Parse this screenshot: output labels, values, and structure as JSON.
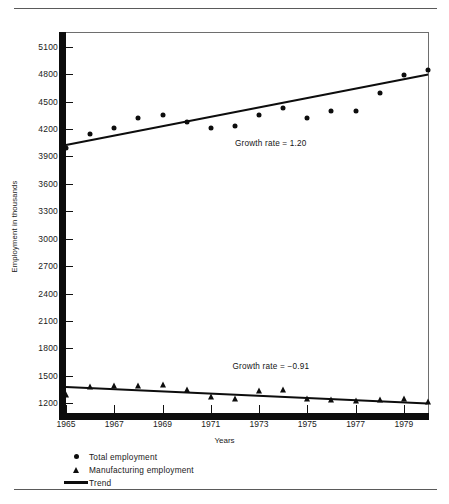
{
  "chart_data": {
    "type": "scatter",
    "title": "",
    "xlabel": "Years",
    "ylabel": "Employment in thousands",
    "xlim": [
      1965,
      1980
    ],
    "ylim": [
      1050,
      5250
    ],
    "ytick_labels": [
      "5100",
      "4800",
      "4500",
      "4200",
      "3900",
      "3600",
      "3300",
      "3000",
      "2700",
      "2400",
      "2100",
      "1800",
      "1500",
      "1200"
    ],
    "ytick_values": [
      5100,
      4800,
      4500,
      4200,
      3900,
      3600,
      3300,
      3000,
      2700,
      2400,
      2100,
      1800,
      1500,
      1200
    ],
    "xtick_labels": [
      "1965",
      "1967",
      "1969",
      "1971",
      "1973",
      "1975",
      "1977",
      "1979"
    ],
    "xtick_values": [
      1965,
      1967,
      1969,
      1971,
      1973,
      1975,
      1977,
      1979
    ],
    "grid": false,
    "legend_position": "below-axes",
    "series": [
      {
        "name": "Total employment",
        "marker": "circle",
        "x": [
          1965,
          1966,
          1967,
          1968,
          1969,
          1970,
          1971,
          1972,
          1973,
          1974,
          1975,
          1976,
          1977,
          1978,
          1979,
          1980
        ],
        "values": [
          3990,
          4140,
          4215,
          4320,
          4355,
          4280,
          4215,
          4230,
          4355,
          4430,
          4325,
          4400,
          4400,
          4595,
          4790,
          4840
        ]
      },
      {
        "name": "Manufacturing employment",
        "marker": "triangle",
        "x": [
          1965,
          1966,
          1967,
          1968,
          1969,
          1970,
          1971,
          1972,
          1973,
          1974,
          1975,
          1976,
          1977,
          1978,
          1979,
          1980
        ],
        "values": [
          1290,
          1380,
          1390,
          1390,
          1400,
          1340,
          1270,
          1250,
          1330,
          1340,
          1250,
          1240,
          1230,
          1240,
          1245,
          1210
        ]
      }
    ],
    "trend_lines": [
      {
        "name": "Trend",
        "series": "Total employment",
        "x": [
          1965,
          1980
        ],
        "values": [
          4040,
          4810
        ],
        "annotation": "Growth rate  =  1.20",
        "growth_rate": 1.2
      },
      {
        "name": "Trend",
        "series": "Manufacturing employment",
        "x": [
          1965,
          1980
        ],
        "values": [
          1385,
          1205
        ],
        "annotation": "Growth rate  =  −0.91",
        "growth_rate": -0.91
      }
    ],
    "annotations": [
      {
        "text": "Growth rate  =  1.20"
      },
      {
        "text": "Growth rate  =  −0.91"
      }
    ],
    "legend": [
      {
        "label": "Total employment",
        "marker": "circle"
      },
      {
        "label": "Manufacturing employment",
        "marker": "triangle"
      },
      {
        "label": "Trend",
        "marker": "line"
      }
    ],
    "colors": {
      "ink": "#0d0d0d",
      "rule": "#5a5a5a"
    }
  }
}
